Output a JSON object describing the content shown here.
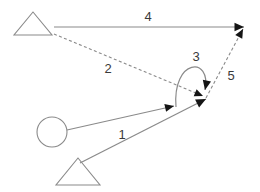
{
  "diagram": {
    "canvas": {
      "width": 260,
      "height": 192,
      "background": "#ffffff"
    },
    "style": {
      "line_color": "#8a8a8a",
      "arrowhead_color": "#151515",
      "label_color": "#3a3a3a",
      "shape_stroke": "#8a8a8a"
    },
    "nodes": [
      {
        "id": "triangle-top-left",
        "shape": "triangle",
        "name": "triangle-top-left",
        "apex": {
          "x": 33,
          "y": 12
        },
        "left": {
          "x": 14,
          "y": 35
        },
        "right": {
          "x": 52,
          "y": 35
        }
      },
      {
        "id": "circle-left",
        "shape": "circle",
        "name": "circle-left",
        "cx": 52,
        "cy": 132,
        "r": 15
      },
      {
        "id": "triangle-bottom",
        "shape": "triangle",
        "name": "triangle-bottom",
        "apex": {
          "x": 78,
          "y": 158
        },
        "left": {
          "x": 56,
          "y": 185
        },
        "right": {
          "x": 100,
          "y": 185
        }
      }
    ],
    "edges": [
      {
        "id": "edge-1",
        "label": "1",
        "style": "solid",
        "from": "circle-left",
        "to": "convergence-point",
        "x1": 67,
        "y1": 130,
        "x2": 174,
        "y2": 106,
        "label_x": 122,
        "label_y": 136,
        "arrowhead": "end"
      },
      {
        "id": "edge-2",
        "label": "2",
        "style": "dashed",
        "from": "triangle-top-left",
        "to": "convergence-point",
        "x1": 54,
        "y1": 34,
        "x2": 203,
        "y2": 96,
        "label_x": 108,
        "label_y": 70,
        "arrowhead": "end"
      },
      {
        "id": "edge-3",
        "label": "3",
        "style": "solid-curved",
        "from": "convergence-point",
        "to": "convergence-point",
        "arc_start_x": 176,
        "arc_start_y": 107,
        "arc_ctrl1_x": 172,
        "arc_ctrl1_y": 58,
        "arc_ctrl2_x": 212,
        "arc_ctrl2_y": 56,
        "arc_end_x": 205,
        "arc_end_y": 90,
        "label_x": 196,
        "label_y": 58,
        "arrowhead": "end"
      },
      {
        "id": "edge-4",
        "label": "4",
        "style": "solid",
        "from": "triangle-top-left",
        "to": "top-right-point",
        "x1": 54,
        "y1": 27,
        "x2": 244,
        "y2": 27,
        "label_x": 148,
        "label_y": 18,
        "arrowhead": "end"
      },
      {
        "id": "edge-5",
        "label": "5",
        "style": "dashed",
        "from": "convergence-point",
        "to": "top-right-point",
        "x1": 206,
        "y1": 98,
        "x2": 243,
        "y2": 29,
        "label_x": 231,
        "label_y": 77,
        "arrowhead": "end"
      },
      {
        "id": "edge-6",
        "label": "",
        "style": "solid",
        "from": "triangle-bottom",
        "to": "convergence-point",
        "x1": 80,
        "y1": 163,
        "x2": 206,
        "y2": 99,
        "label_x": 0,
        "label_y": 0,
        "arrowhead": "end"
      }
    ],
    "labels": [
      {
        "id": "label-1",
        "text": "1",
        "x": 122,
        "y": 136
      },
      {
        "id": "label-2",
        "text": "2",
        "x": 108,
        "y": 70
      },
      {
        "id": "label-3",
        "text": "3",
        "x": 196,
        "y": 58
      },
      {
        "id": "label-4",
        "text": "4",
        "x": 148,
        "y": 18
      },
      {
        "id": "label-5",
        "text": "5",
        "x": 231,
        "y": 77
      }
    ]
  }
}
